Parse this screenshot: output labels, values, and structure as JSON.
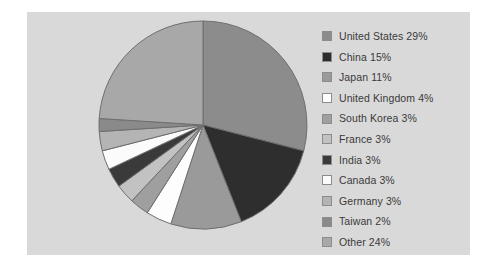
{
  "panel": {
    "background_color": "#d9d9d9"
  },
  "chart_data": {
    "type": "pie",
    "title": "",
    "subtitle": "",
    "xlabel": "",
    "ylabel": "",
    "grid": false,
    "legend_position": "right",
    "start_angle_deg": 0,
    "direction": "clockwise",
    "total_percent": 100,
    "categories": [
      "United States",
      "China",
      "Japan",
      "United Kingdom",
      "South Korea",
      "France",
      "India",
      "Canada",
      "Germany",
      "Taiwan",
      "Other"
    ],
    "values": [
      29,
      15,
      11,
      4,
      3,
      3,
      3,
      3,
      3,
      2,
      24
    ],
    "value_unit": "%",
    "colors": [
      "#8c8c8c",
      "#2e2e2e",
      "#9a9a9a",
      "#fdfdfd",
      "#9f9f9f",
      "#c2c2c2",
      "#3a3a3a",
      "#fbfbfb",
      "#b4b4b4",
      "#8a8a8a",
      "#a8a8a8"
    ],
    "slice_edge_color": "#6e6e6e",
    "slices": [
      {
        "label": "United States",
        "value": 29,
        "display": "United States 29%",
        "color": "#8c8c8c"
      },
      {
        "label": "China",
        "value": 15,
        "display": "China 15%",
        "color": "#2e2e2e"
      },
      {
        "label": "Japan",
        "value": 11,
        "display": "Japan 11%",
        "color": "#9a9a9a"
      },
      {
        "label": "United Kingdom",
        "value": 4,
        "display": "United Kingdom 4%",
        "color": "#fdfdfd"
      },
      {
        "label": "South Korea",
        "value": 3,
        "display": "South Korea 3%",
        "color": "#9f9f9f"
      },
      {
        "label": "France",
        "value": 3,
        "display": "France 3%",
        "color": "#c2c2c2"
      },
      {
        "label": "India",
        "value": 3,
        "display": "India 3%",
        "color": "#3a3a3a"
      },
      {
        "label": "Canada",
        "value": 3,
        "display": "Canada 3%",
        "color": "#fbfbfb"
      },
      {
        "label": "Germany",
        "value": 3,
        "display": "Germany 3%",
        "color": "#b4b4b4"
      },
      {
        "label": "Taiwan",
        "value": 2,
        "display": "Taiwan 2%",
        "color": "#8a8a8a"
      },
      {
        "label": "Other",
        "value": 24,
        "display": "Other 24%",
        "color": "#a8a8a8"
      }
    ]
  },
  "legend": {
    "items": [
      {
        "label": "United States 29%",
        "color": "#8c8c8c"
      },
      {
        "label": "China 15%",
        "color": "#2e2e2e"
      },
      {
        "label": "Japan 11%",
        "color": "#9a9a9a"
      },
      {
        "label": "United Kingdom 4%",
        "color": "#fdfdfd"
      },
      {
        "label": "South Korea 3%",
        "color": "#9f9f9f"
      },
      {
        "label": "France 3%",
        "color": "#c2c2c2"
      },
      {
        "label": "India 3%",
        "color": "#3a3a3a"
      },
      {
        "label": "Canada 3%",
        "color": "#fbfbfb"
      },
      {
        "label": "Germany 3%",
        "color": "#b4b4b4"
      },
      {
        "label": "Taiwan 2%",
        "color": "#8a8a8a"
      },
      {
        "label": "Other 24%",
        "color": "#a8a8a8"
      }
    ]
  }
}
